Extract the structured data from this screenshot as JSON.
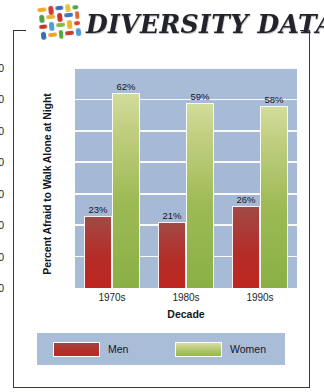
{
  "header": {
    "title": "DIVERSITY DATA",
    "logo_name": "diversity-mosaic-logo",
    "logo_tiles": [
      {
        "x": 1,
        "y": 2,
        "w": 9,
        "h": 4,
        "c": "#f0a92c"
      },
      {
        "x": 12,
        "y": 1,
        "w": 5,
        "h": 9,
        "c": "#d23b2e"
      },
      {
        "x": 19,
        "y": 2,
        "w": 8,
        "h": 4,
        "c": "#3d6fb5"
      },
      {
        "x": 29,
        "y": 1,
        "w": 5,
        "h": 8,
        "c": "#e8c53a"
      },
      {
        "x": 36,
        "y": 3,
        "w": 6,
        "h": 4,
        "c": "#56a03e"
      },
      {
        "x": 2,
        "y": 9,
        "w": 5,
        "h": 8,
        "c": "#4b9f45"
      },
      {
        "x": 9,
        "y": 10,
        "w": 9,
        "h": 4,
        "c": "#e9b52e"
      },
      {
        "x": 20,
        "y": 9,
        "w": 5,
        "h": 9,
        "c": "#c9352b"
      },
      {
        "x": 27,
        "y": 10,
        "w": 9,
        "h": 4,
        "c": "#3f78bd"
      },
      {
        "x": 38,
        "y": 9,
        "w": 4,
        "h": 8,
        "c": "#e4672c"
      },
      {
        "x": 1,
        "y": 19,
        "w": 8,
        "h": 4,
        "c": "#c7342a"
      },
      {
        "x": 11,
        "y": 17,
        "w": 5,
        "h": 9,
        "c": "#4a9fd6"
      },
      {
        "x": 18,
        "y": 19,
        "w": 9,
        "h": 4,
        "c": "#89bb42"
      },
      {
        "x": 29,
        "y": 17,
        "w": 5,
        "h": 9,
        "c": "#edb42d"
      },
      {
        "x": 36,
        "y": 19,
        "w": 6,
        "h": 4,
        "c": "#d8452f"
      },
      {
        "x": 2,
        "y": 26,
        "w": 5,
        "h": 8,
        "c": "#2f6fb3"
      },
      {
        "x": 9,
        "y": 28,
        "w": 9,
        "h": 4,
        "c": "#f0a42d"
      },
      {
        "x": 20,
        "y": 26,
        "w": 4,
        "h": 9,
        "c": "#57a73f"
      },
      {
        "x": 26,
        "y": 28,
        "w": 9,
        "h": 4,
        "c": "#d03a2d"
      },
      {
        "x": 37,
        "y": 26,
        "w": 5,
        "h": 8,
        "c": "#4e9ad4"
      }
    ]
  },
  "chart_data": {
    "type": "bar",
    "title": "",
    "xlabel": "Decade",
    "ylabel": "Percent Afraid to Walk Alone at Night",
    "categories": [
      "1970s",
      "1980s",
      "1990s"
    ],
    "series": [
      {
        "name": "Men",
        "color": "#b42d28",
        "values": [
          23,
          21,
          26
        ],
        "labels": [
          "23%",
          "21%",
          "26%"
        ]
      },
      {
        "name": "Women",
        "color": "#9dba55",
        "values": [
          62,
          59,
          58
        ],
        "labels": [
          "62%",
          "59%",
          "58%"
        ]
      }
    ],
    "ylim": [
      0,
      70
    ],
    "yticks": [
      0,
      10,
      20,
      30,
      40,
      50,
      60,
      70
    ],
    "ytick_labels": [
      "0",
      "10",
      "20",
      "30",
      "40",
      "50",
      "60",
      "70"
    ],
    "grid": true,
    "legend_position": "bottom",
    "plot_background": "#a9bcd8"
  }
}
